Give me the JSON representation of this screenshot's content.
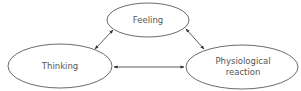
{
  "diagram": {
    "nodes": [
      {
        "id": "feeling",
        "label_lines": [
          "Feeling"
        ]
      },
      {
        "id": "thinking",
        "label_lines": [
          "Thinking"
        ]
      },
      {
        "id": "physiological",
        "label_lines": [
          "Physiological",
          "reaction"
        ]
      }
    ],
    "edges": [
      {
        "from": "thinking",
        "to": "feeling",
        "bidirectional": true
      },
      {
        "from": "feeling",
        "to": "physiological",
        "bidirectional": true
      },
      {
        "from": "thinking",
        "to": "physiological",
        "bidirectional": true
      }
    ],
    "colors": {
      "stroke": "#333333",
      "text": "#555555",
      "background": "#ffffff"
    }
  }
}
